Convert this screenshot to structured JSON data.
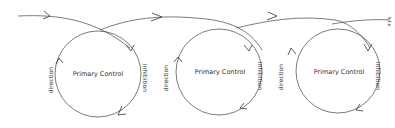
{
  "diagram": {
    "center_label": "Primary Control",
    "left_label": "direction",
    "right_label": "inhibition",
    "end_label": "h.f.e.",
    "loops": [
      {
        "center_label": "Primary Control",
        "left_label": "direction",
        "right_label": "inhibition"
      },
      {
        "center_label": "Primary Control",
        "left_label": "direction",
        "right_label": "inhibition"
      },
      {
        "center_label": "Primary Control",
        "left_label": "direction",
        "right_label": "inhibition"
      }
    ]
  }
}
